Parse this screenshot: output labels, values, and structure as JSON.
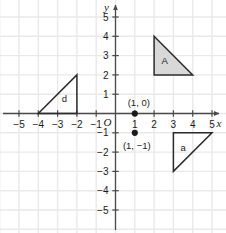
{
  "chart_data": {
    "type": "scatter",
    "title": "",
    "xlabel": "x",
    "ylabel": "y",
    "origin_label": "O",
    "xlim": [
      -6,
      6
    ],
    "ylim": [
      -6,
      6
    ],
    "grid": true,
    "x_ticks": [
      -5,
      -4,
      -3,
      -2,
      -1,
      1,
      2,
      3,
      4,
      5
    ],
    "y_ticks": [
      5,
      4,
      3,
      2,
      1,
      -1,
      -2,
      -3,
      -4,
      -5
    ],
    "x_tick_labels": [
      "−5",
      "−4",
      "−3",
      "−2",
      "−1",
      "1",
      "2",
      "3",
      "4",
      "5"
    ],
    "y_tick_labels": [
      "5",
      "4",
      "3",
      "2",
      "1",
      "−1",
      "−2",
      "−3",
      "−4",
      "−5"
    ],
    "points": [
      {
        "label": "(1, 0)",
        "x": 1,
        "y": 0,
        "label_dx": 4,
        "label_dy": -8
      },
      {
        "label": "(1, −1)",
        "x": 1,
        "y": -1,
        "label_dx": 2,
        "label_dy": 16
      }
    ],
    "shapes": [
      {
        "name": "A",
        "label": "A",
        "filled": true,
        "fill": "#d8d8d8",
        "stroke": "#2b2b2b",
        "vertices": [
          [
            2,
            4
          ],
          [
            2,
            2
          ],
          [
            4,
            2
          ]
        ],
        "label_x": 2.55,
        "label_y": 2.75
      },
      {
        "name": "a",
        "label": "a",
        "filled": false,
        "fill": "none",
        "stroke": "#2b2b2b",
        "vertices": [
          [
            3,
            -1
          ],
          [
            5,
            -1
          ],
          [
            3,
            -3
          ]
        ],
        "label_x": 3.5,
        "label_y": -1.75
      },
      {
        "name": "d",
        "label": "d",
        "filled": false,
        "fill": "none",
        "stroke": "#2b2b2b",
        "vertices": [
          [
            -4,
            0
          ],
          [
            -2,
            0
          ],
          [
            -2,
            2
          ]
        ],
        "label_x": -2.65,
        "label_y": 0.75
      }
    ],
    "colors": {
      "grid": "#e9e9e9",
      "axis": "#4a4a4a",
      "shape_stroke": "#2b2b2b",
      "shape_fill": "#d8d8d8",
      "text": "#1a1a1a",
      "background": "#ffffff"
    }
  }
}
